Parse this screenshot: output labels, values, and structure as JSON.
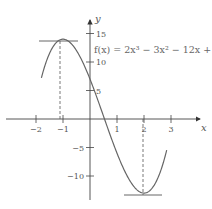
{
  "chart_data": {
    "type": "line",
    "title": "",
    "function_label": "f(x) = 2x³ − 3x² − 12x + 7",
    "xlabel": "x",
    "ylabel": "y",
    "xlim": [
      -2.1,
      3.6
    ],
    "ylim": [
      -14,
      17
    ],
    "x_ticks": [
      -2,
      -1,
      1,
      2,
      3
    ],
    "x_tick_labels": [
      "−2",
      "−1",
      "1",
      "2",
      "3"
    ],
    "y_ticks": [
      15,
      10,
      5,
      -5,
      -10
    ],
    "y_tick_labels": [
      "15",
      "10",
      "5",
      "−5",
      "−10"
    ],
    "grid": false,
    "series": [
      {
        "name": "f(x) = 2x³ − 3x² − 12x + 7",
        "x": [
          -1.8,
          -1.5,
          -1.0,
          -0.5,
          0,
          0.5,
          1.0,
          1.5,
          2.0,
          2.5,
          2.85
        ],
        "y": [
          3.6,
          11.5,
          14,
          12.5,
          7,
          0.5,
          -6,
          -11,
          -13,
          -8,
          -3.6
        ]
      }
    ],
    "annotations": [
      {
        "type": "horizontal_tangent",
        "x": -1,
        "y": 14,
        "label": "local maximum"
      },
      {
        "type": "horizontal_tangent",
        "x": 2,
        "y": -13,
        "label": "local minimum"
      },
      {
        "type": "dashed_vertical",
        "x": -1,
        "from_y": 14,
        "to_y": 0
      },
      {
        "type": "dashed_vertical",
        "x": 2,
        "from_y": 0,
        "to_y": -13
      }
    ]
  },
  "axes": {
    "x_label": "x",
    "y_label": "y"
  }
}
